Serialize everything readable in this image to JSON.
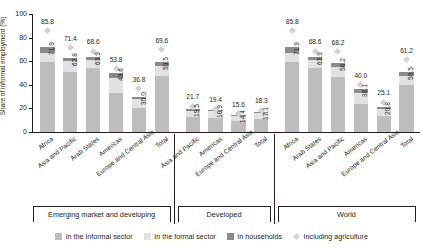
{
  "chart_data": {
    "type": "bar",
    "title": "",
    "subtitle": "",
    "xlabel": "",
    "ylabel": "Share of informal employment (%)",
    "ylim": [
      0,
      100
    ],
    "yticks": [
      0,
      20,
      40,
      60,
      80,
      100
    ],
    "grid": false,
    "stacked": true,
    "legend_position": "bottom",
    "legend": [
      {
        "label": "In the informal sector",
        "color": "#bdbdbd",
        "marker": "square"
      },
      {
        "label": "In the formal sector",
        "color": "#e2e2e2",
        "marker": "square"
      },
      {
        "label": "In households",
        "color": "#8a8a8a",
        "marker": "square"
      },
      {
        "label": "Including agriculture",
        "color": "#d2d2d2",
        "marker": "diamond"
      }
    ],
    "series": [
      {
        "name": "In the informal sector",
        "color": "#bdbdbd"
      },
      {
        "name": "In the formal sector",
        "color": "#e2e2e2"
      },
      {
        "name": "In households",
        "color": "#8a8a8a"
      }
    ],
    "groups": [
      {
        "name": "Emerging market and developing",
        "categories": [
          "Africa",
          "Asia and Pacific",
          "Arab States",
          "Americas",
          "Europe and Central Asia",
          "Total"
        ],
        "bars": [
          {
            "category": "Africa",
            "total": 71.9,
            "informal": 59.0,
            "formal": 8.0,
            "households": 4.9,
            "including_agriculture": 85.8
          },
          {
            "category": "Asia and Pacific",
            "total": 62.8,
            "informal": 50.5,
            "formal": 9.3,
            "households": 3.0,
            "including_agriculture": 71.4
          },
          {
            "category": "Arab States",
            "total": 63.9,
            "informal": 54.4,
            "formal": 6.5,
            "households": 3.0,
            "including_agriculture": 68.6
          },
          {
            "category": "Americas",
            "total": 49.6,
            "informal": 33.4,
            "formal": 12.2,
            "households": 4.0,
            "including_agriculture": 53.8
          },
          {
            "category": "Europe and Central Asia",
            "total": 30.0,
            "informal": 20.6,
            "formal": 7.4,
            "households": 2.0,
            "including_agriculture": 36.8
          },
          {
            "category": "Total",
            "total": 59.5,
            "informal": 47.4,
            "formal": 8.7,
            "households": 3.4,
            "including_agriculture": 69.6
          }
        ]
      },
      {
        "name": "Developed",
        "categories": [
          "Asia and Pacific",
          "Americas",
          "Europe and Central Asia",
          "Total"
        ],
        "bars": [
          {
            "category": "Asia and Pacific",
            "total": 19.5,
            "informal": 13.0,
            "formal": 5.2,
            "households": 1.3,
            "including_agriculture": 21.7
          },
          {
            "category": "Americas",
            "total": 18.9,
            "informal": 11.9,
            "formal": 6.0,
            "households": 1.0,
            "including_agriculture": 19.4
          },
          {
            "category": "Europe and Central Asia",
            "total": 14.4,
            "informal": 9.0,
            "formal": 4.4,
            "households": 1.0,
            "including_agriculture": 15.6
          },
          {
            "category": "Total",
            "total": 17.1,
            "informal": 11.0,
            "formal": 5.1,
            "households": 1.0,
            "including_agriculture": 18.3
          }
        ]
      },
      {
        "name": "World",
        "categories": [
          "Africa",
          "Arab States",
          "Asia and Pacific",
          "Americas",
          "Europe and Central Asia",
          "Total"
        ],
        "bars": [
          {
            "category": "Africa",
            "total": 71.9,
            "informal": 59.0,
            "formal": 8.0,
            "households": 4.9,
            "including_agriculture": 85.8
          },
          {
            "category": "Arab States",
            "total": 63.9,
            "informal": 54.4,
            "formal": 6.5,
            "households": 3.0,
            "including_agriculture": 68.6
          },
          {
            "category": "Asia and Pacific",
            "total": 58.2,
            "informal": 47.0,
            "formal": 8.4,
            "households": 2.8,
            "including_agriculture": 68.2
          },
          {
            "category": "Americas",
            "total": 36.1,
            "informal": 24.0,
            "formal": 9.1,
            "households": 3.0,
            "including_agriculture": 40.0
          },
          {
            "category": "Europe and Central Asia",
            "total": 20.8,
            "informal": 13.6,
            "formal": 5.7,
            "households": 1.5,
            "including_agriculture": 25.1
          },
          {
            "category": "Total",
            "total": 50.5,
            "informal": 40.0,
            "formal": 7.6,
            "households": 2.9,
            "including_agriculture": 61.2
          }
        ]
      }
    ]
  }
}
